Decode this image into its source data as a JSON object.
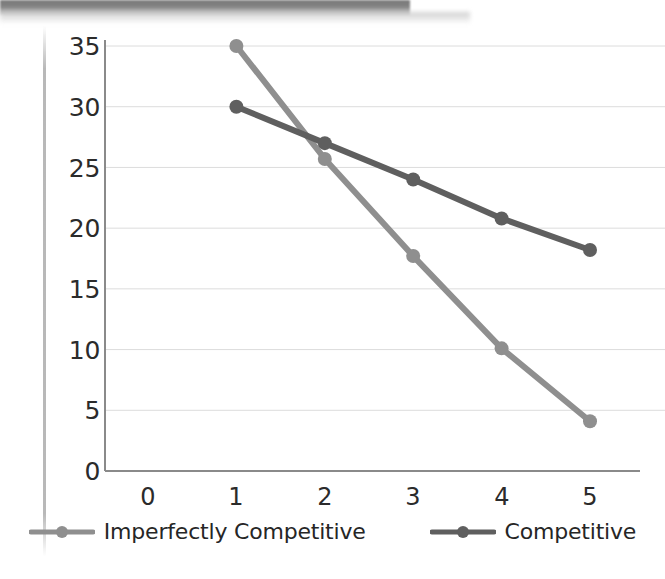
{
  "chart_data": {
    "type": "line",
    "title": "",
    "xlabel": "",
    "ylabel": "",
    "x": [
      1,
      2,
      3,
      4,
      5
    ],
    "xlim": [
      0,
      5
    ],
    "ylim": [
      0,
      35
    ],
    "xticks": [
      "0",
      "1",
      "2",
      "3",
      "4",
      "5"
    ],
    "yticks": [
      "0",
      "5",
      "10",
      "15",
      "20",
      "25",
      "30",
      "35"
    ],
    "grid": "horizontal",
    "legend_position": "bottom",
    "series": [
      {
        "name": "Imperfectly Competitive",
        "color": "#8f8f8f",
        "values": [
          35.0,
          25.7,
          17.7,
          10.1,
          4.1
        ]
      },
      {
        "name": "Competitive",
        "color": "#5f5f5f",
        "values": [
          30.0,
          27.0,
          24.0,
          20.8,
          18.2
        ]
      }
    ]
  },
  "axes": {
    "y_tick_labels": [
      "35",
      "30",
      "25",
      "20",
      "15",
      "10",
      "5",
      "0"
    ],
    "x_tick_labels": [
      "0",
      "1",
      "2",
      "3",
      "4",
      "5"
    ]
  },
  "legend": {
    "items": [
      {
        "label": "Imperfectly Competitive",
        "color": "#8f8f8f"
      },
      {
        "label": "Competitive",
        "color": "#5f5f5f"
      }
    ]
  },
  "colors": {
    "series_light": "#8f8f8f",
    "series_dark": "#5f5f5f",
    "axis": "#8a8a8a",
    "gridline": "#dcdcdc",
    "text": "#2b2b2b"
  }
}
